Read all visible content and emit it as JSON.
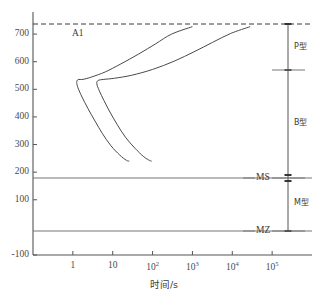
{
  "chart_data": {
    "type": "line",
    "title": "",
    "xlabel": "时间/s",
    "ylabel": "",
    "xscale": "log",
    "x_tick_labels": [
      "1",
      "10",
      "10²",
      "10³",
      "10⁴",
      "10⁵"
    ],
    "x_tick_bases": [
      "1",
      "10",
      "10",
      "10",
      "10",
      "10"
    ],
    "x_tick_exps": [
      "",
      "",
      "2",
      "3",
      "4",
      "5"
    ],
    "x_tick_values": [
      1,
      10,
      100,
      1000,
      10000,
      100000
    ],
    "xlim": [
      0.1,
      1000000
    ],
    "y_tick_labels": [
      "700",
      "600",
      "500",
      "400",
      "300",
      "200",
      "100",
      "-100"
    ],
    "y_tick_values": [
      700,
      600,
      500,
      400,
      300,
      200,
      100,
      -100
    ],
    "ylim": [
      -100,
      780
    ],
    "grid": false,
    "legend": "none",
    "annotations": [
      {
        "name": "a1-line-label",
        "text": "A1",
        "value": 727,
        "style": "dashed"
      },
      {
        "name": "ms-line-label",
        "text": "MS",
        "value": 240,
        "style": "solid"
      },
      {
        "name": "mz-line-label",
        "text": "MZ",
        "value": 75,
        "style": "solid"
      }
    ],
    "zones": [
      {
        "name": "p-zone",
        "label": "P型",
        "from": 727,
        "to": 575
      },
      {
        "name": "b-zone",
        "label": "B型",
        "from": 575,
        "to": 240
      },
      {
        "name": "m-zone",
        "label": "M型",
        "from": 240,
        "to": 75
      }
    ],
    "series": [
      {
        "name": "transformation-start-curve",
        "points": [
          [
            1000,
            727
          ],
          [
            300,
            700
          ],
          [
            120,
            665
          ],
          [
            45,
            628
          ],
          [
            16,
            592
          ],
          [
            6.5,
            563
          ],
          [
            3.0,
            545
          ],
          [
            1.8,
            536
          ],
          [
            1.35,
            535
          ],
          [
            1.25,
            525
          ],
          [
            1.35,
            505
          ],
          [
            1.7,
            472
          ],
          [
            2.4,
            430
          ],
          [
            3.6,
            385
          ],
          [
            5.5,
            340
          ],
          [
            9.0,
            296
          ],
          [
            15,
            262
          ],
          [
            22,
            243
          ],
          [
            26,
            240
          ]
        ]
      },
      {
        "name": "transformation-finish-curve",
        "points": [
          [
            28000,
            727
          ],
          [
            9000,
            702
          ],
          [
            3200,
            670
          ],
          [
            1100,
            636
          ],
          [
            350,
            602
          ],
          [
            100,
            572
          ],
          [
            30,
            551
          ],
          [
            11,
            540
          ],
          [
            6.0,
            536
          ],
          [
            4.3,
            532
          ],
          [
            4.0,
            520
          ],
          [
            4.6,
            495
          ],
          [
            6.0,
            460
          ],
          [
            8.5,
            418
          ],
          [
            13,
            372
          ],
          [
            21,
            326
          ],
          [
            36,
            287
          ],
          [
            60,
            256
          ],
          [
            85,
            242
          ],
          [
            95,
            240
          ]
        ]
      }
    ]
  },
  "axis": {
    "x_title": "时间/s"
  }
}
